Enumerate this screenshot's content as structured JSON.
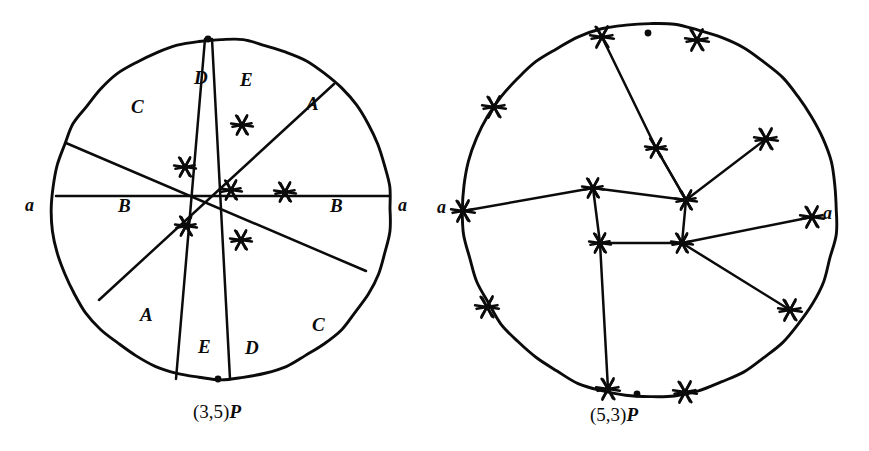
{
  "figure": {
    "kind": "mathematical-diagram",
    "ink_color": "#0b0b0b",
    "background_color": "#ffffff"
  },
  "panels": [
    {
      "id": "left",
      "caption": "(3,5)P",
      "caption_coords": "(3,5)",
      "caption_point": "P",
      "circle": {
        "cx": 221,
        "cy": 209,
        "r": 170
      },
      "boundary_markers": [
        {
          "name": "top-dot",
          "x": 208,
          "y": 39,
          "type": "dot"
        },
        {
          "name": "bottom-dot",
          "x": 218,
          "y": 379,
          "type": "dot"
        }
      ],
      "edge_labels": [
        {
          "name": "a-left",
          "text": "a",
          "x": 25,
          "y": 196
        },
        {
          "name": "a-right",
          "text": "a",
          "x": 398,
          "y": 196
        }
      ],
      "region_labels": [
        {
          "text": "C",
          "x": 131,
          "y": 97
        },
        {
          "text": "D",
          "x": 194,
          "y": 68
        },
        {
          "text": "E",
          "x": 240,
          "y": 70
        },
        {
          "text": "A",
          "x": 306,
          "y": 94
        },
        {
          "text": "B",
          "x": 118,
          "y": 196
        },
        {
          "text": "B",
          "x": 330,
          "y": 196
        },
        {
          "text": "A",
          "x": 140,
          "y": 305
        },
        {
          "text": "E",
          "x": 198,
          "y": 337
        },
        {
          "text": "D",
          "x": 245,
          "y": 338
        },
        {
          "text": "C",
          "x": 312,
          "y": 315
        }
      ],
      "chords": [
        {
          "name": "chord-1",
          "x1": 205,
          "y1": 39,
          "x2": 176,
          "y2": 379
        },
        {
          "name": "chord-2",
          "x1": 212,
          "y1": 39,
          "x2": 230,
          "y2": 379
        },
        {
          "name": "chord-3",
          "x1": 66,
          "y1": 143,
          "x2": 366,
          "y2": 271
        },
        {
          "name": "chord-4",
          "x1": 334,
          "y1": 84,
          "x2": 99,
          "y2": 300
        },
        {
          "name": "chord-5",
          "x1": 389,
          "y1": 196,
          "x2": 56,
          "y2": 196
        }
      ],
      "star_vertices": [
        {
          "name": "v-upper",
          "x": 242,
          "y": 125
        },
        {
          "name": "v-left-upper",
          "x": 185,
          "y": 167
        },
        {
          "name": "v-center",
          "x": 231,
          "y": 190
        },
        {
          "name": "v-right",
          "x": 285,
          "y": 192
        },
        {
          "name": "v-left-lower",
          "x": 186,
          "y": 226
        },
        {
          "name": "v-lower",
          "x": 241,
          "y": 240
        }
      ]
    },
    {
      "id": "right",
      "caption": "(5,3)P",
      "caption_coords": "(5,3)",
      "caption_point": "P",
      "circle": {
        "cx": 650,
        "cy": 210,
        "r": 187
      },
      "boundary_markers": [
        {
          "name": "top-dot",
          "x": 648,
          "y": 33,
          "type": "dot"
        },
        {
          "name": "bottom-dot",
          "x": 637,
          "y": 394,
          "type": "dot"
        }
      ],
      "edge_labels": [
        {
          "name": "a-left",
          "text": "a",
          "x": 437,
          "y": 198
        },
        {
          "name": "a-right",
          "text": "a",
          "x": 823,
          "y": 204
        },
        {
          "name": "a-left-star",
          "x": 463,
          "y": 211
        },
        {
          "name": "a-right-star",
          "x": 812,
          "y": 217
        }
      ],
      "chords": [
        {
          "name": "chord-1",
          "points": "602,37 656,148 686,200 766,139"
        },
        {
          "name": "chord-2",
          "points": "463,211 593,188 686,200"
        },
        {
          "name": "chord-3",
          "points": "656,148 686,200 682,243 812,217"
        },
        {
          "name": "chord-4",
          "points": "593,188 600,243 682,243 790,310"
        },
        {
          "name": "chord-5",
          "points": "600,243 608,389"
        }
      ],
      "inner_star_vertices": [
        {
          "name": "inner-top",
          "x": 656,
          "y": 148
        },
        {
          "name": "inner-left",
          "x": 593,
          "y": 188
        },
        {
          "name": "inner-right",
          "x": 686,
          "y": 200
        },
        {
          "name": "inner-lower-left",
          "x": 600,
          "y": 243
        },
        {
          "name": "inner-lower-right",
          "x": 682,
          "y": 243
        }
      ],
      "boundary_star_vertices": [
        {
          "name": "b-1",
          "x": 602,
          "y": 37
        },
        {
          "name": "b-2",
          "x": 697,
          "y": 40
        },
        {
          "name": "b-3",
          "x": 766,
          "y": 139
        },
        {
          "name": "b-4",
          "x": 812,
          "y": 217
        },
        {
          "name": "b-5",
          "x": 790,
          "y": 310
        },
        {
          "name": "b-6",
          "x": 685,
          "y": 392
        },
        {
          "name": "b-7",
          "x": 608,
          "y": 389
        },
        {
          "name": "b-8",
          "x": 487,
          "y": 307
        },
        {
          "name": "b-9",
          "x": 463,
          "y": 211
        },
        {
          "name": "b-10",
          "x": 494,
          "y": 107
        }
      ]
    }
  ]
}
